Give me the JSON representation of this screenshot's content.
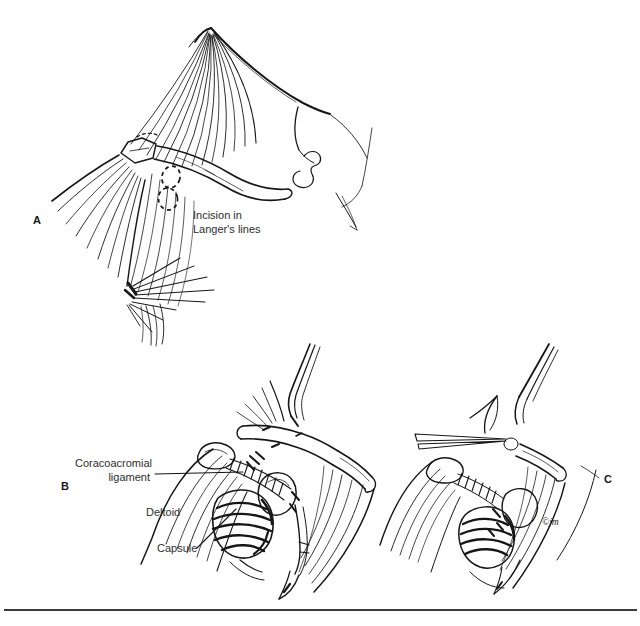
{
  "page": {
    "background_color": "#ffffff",
    "ink_color": "#161616",
    "label_color": "#2e2e2e"
  },
  "figure": {
    "panel_a": {
      "letter": "A",
      "annotation_line1": "Incision in",
      "annotation_line2": "Langer's lines"
    },
    "panel_b": {
      "letter": "B",
      "label_coracoacromial_line1": "Coracoacromial",
      "label_coracoacromial_line2": "ligament",
      "label_deltoid": "Deltoid",
      "label_capsule": "Capsule"
    },
    "panel_c": {
      "letter": "C",
      "artist_signature": "©jm"
    }
  }
}
